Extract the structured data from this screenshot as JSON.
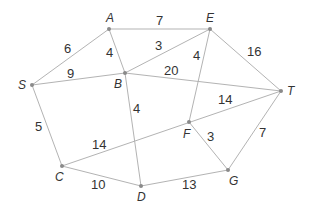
{
  "diagram": {
    "type": "weighted-graph",
    "nodes": [
      {
        "id": "A",
        "x": 109,
        "y": 29,
        "lx": 106,
        "ly": 22
      },
      {
        "id": "E",
        "x": 210,
        "y": 29,
        "lx": 206,
        "ly": 22
      },
      {
        "id": "S",
        "x": 32,
        "y": 85,
        "lx": 18,
        "ly": 89
      },
      {
        "id": "B",
        "x": 125,
        "y": 73,
        "lx": 114,
        "ly": 88
      },
      {
        "id": "T",
        "x": 281,
        "y": 91,
        "lx": 287,
        "ly": 95
      },
      {
        "id": "F",
        "x": 189,
        "y": 122,
        "lx": 183,
        "ly": 138
      },
      {
        "id": "C",
        "x": 62,
        "y": 166,
        "lx": 55,
        "ly": 181
      },
      {
        "id": "D",
        "x": 141,
        "y": 186,
        "lx": 137,
        "ly": 201
      },
      {
        "id": "G",
        "x": 228,
        "y": 170,
        "lx": 229,
        "ly": 185
      }
    ],
    "edges": [
      {
        "from": "S",
        "to": "A",
        "weight": "6",
        "lx": 64,
        "ly": 53
      },
      {
        "from": "A",
        "to": "E",
        "weight": "7",
        "lx": 156,
        "ly": 25
      },
      {
        "from": "A",
        "to": "B",
        "weight": "4",
        "lx": 106,
        "ly": 57
      },
      {
        "from": "B",
        "to": "E",
        "weight": "3",
        "lx": 155,
        "ly": 50
      },
      {
        "from": "S",
        "to": "B",
        "weight": "9",
        "lx": 67,
        "ly": 78
      },
      {
        "from": "B",
        "to": "T",
        "weight": "20",
        "lx": 164,
        "ly": 75
      },
      {
        "from": "E",
        "to": "T",
        "weight": "16",
        "lx": 247,
        "ly": 56
      },
      {
        "from": "E",
        "to": "F",
        "weight": "4",
        "lx": 193,
        "ly": 60
      },
      {
        "from": "S",
        "to": "C",
        "weight": "5",
        "lx": 35,
        "ly": 131
      },
      {
        "from": "C",
        "to": "T",
        "weight": "14",
        "lx": 92,
        "ly": 149
      },
      {
        "from": "B",
        "to": "D",
        "weight": "4",
        "lx": 133,
        "ly": 113
      },
      {
        "from": "C",
        "to": "D",
        "weight": "10",
        "lx": 91,
        "ly": 189
      },
      {
        "from": "D",
        "to": "G",
        "weight": "13",
        "lx": 182,
        "ly": 189
      },
      {
        "from": "F",
        "to": "G",
        "weight": "3",
        "lx": 207,
        "ly": 141
      },
      {
        "from": "G",
        "to": "T",
        "weight": "7",
        "lx": 259,
        "ly": 137
      },
      {
        "from": "F",
        "to": "T",
        "weight": "14",
        "lx": 218,
        "ly": 104
      }
    ]
  }
}
